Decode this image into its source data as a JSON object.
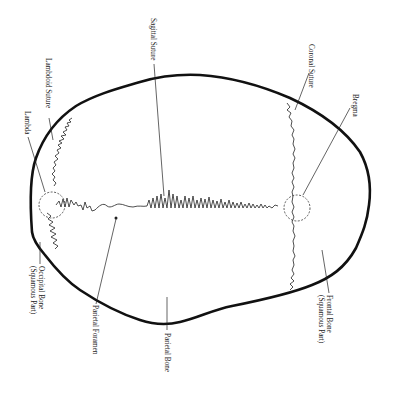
{
  "diagram": {
    "labels": {
      "sagittal_suture": "Sagittal Suture",
      "lambdoid_suture": "Lambdoid Suture",
      "lambda": "Lambda",
      "coronal_suture": "Coronal Suture",
      "bregma": "Bregma",
      "occipital_bone_line1": "Occipital Bone",
      "occipital_bone_line2": "(Squamous Part)",
      "parietal_foramen": "Parietal Foramen",
      "parietal_bone": "Parietal Bone",
      "frontal_bone_line1": "Frontal Bone",
      "frontal_bone_line2": "(Squamous Part)"
    },
    "colors": {
      "outline": "#111111",
      "text": "#1a1a1a",
      "background": "#ffffff"
    }
  }
}
